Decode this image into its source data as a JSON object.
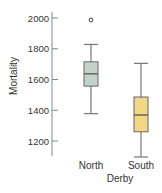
{
  "chart_data": {
    "type": "boxplot",
    "title": "",
    "xlabel": "Derby",
    "ylabel": "Mortality",
    "categories": [
      "North",
      "South"
    ],
    "ylim": [
      1100,
      2050
    ],
    "yticks": [
      1200,
      1400,
      1600,
      1800,
      2000
    ],
    "grid": false,
    "series": [
      {
        "name": "North",
        "min": 1378,
        "q1": 1557,
        "median": 1637,
        "q3": 1715,
        "max": 1828,
        "outliers": [
          1987
        ],
        "color": "#c3d3cb"
      },
      {
        "name": "South",
        "min": 1096,
        "q1": 1260,
        "median": 1369,
        "q3": 1486,
        "max": 1705,
        "outliers": [],
        "color": "#f2d784"
      }
    ]
  }
}
